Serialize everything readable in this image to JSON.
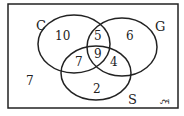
{
  "diagram": {
    "type": "venn-3",
    "universal_symbol": "ξ",
    "sets": [
      {
        "label": "C"
      },
      {
        "label": "G"
      },
      {
        "label": "S"
      }
    ],
    "regions": {
      "only_C": "10",
      "only_G": "6",
      "only_S": "2",
      "C_and_G_only": "5",
      "C_and_S_only": "7",
      "G_and_S_only": "4",
      "C_G_S": "9",
      "outside": "7"
    }
  }
}
